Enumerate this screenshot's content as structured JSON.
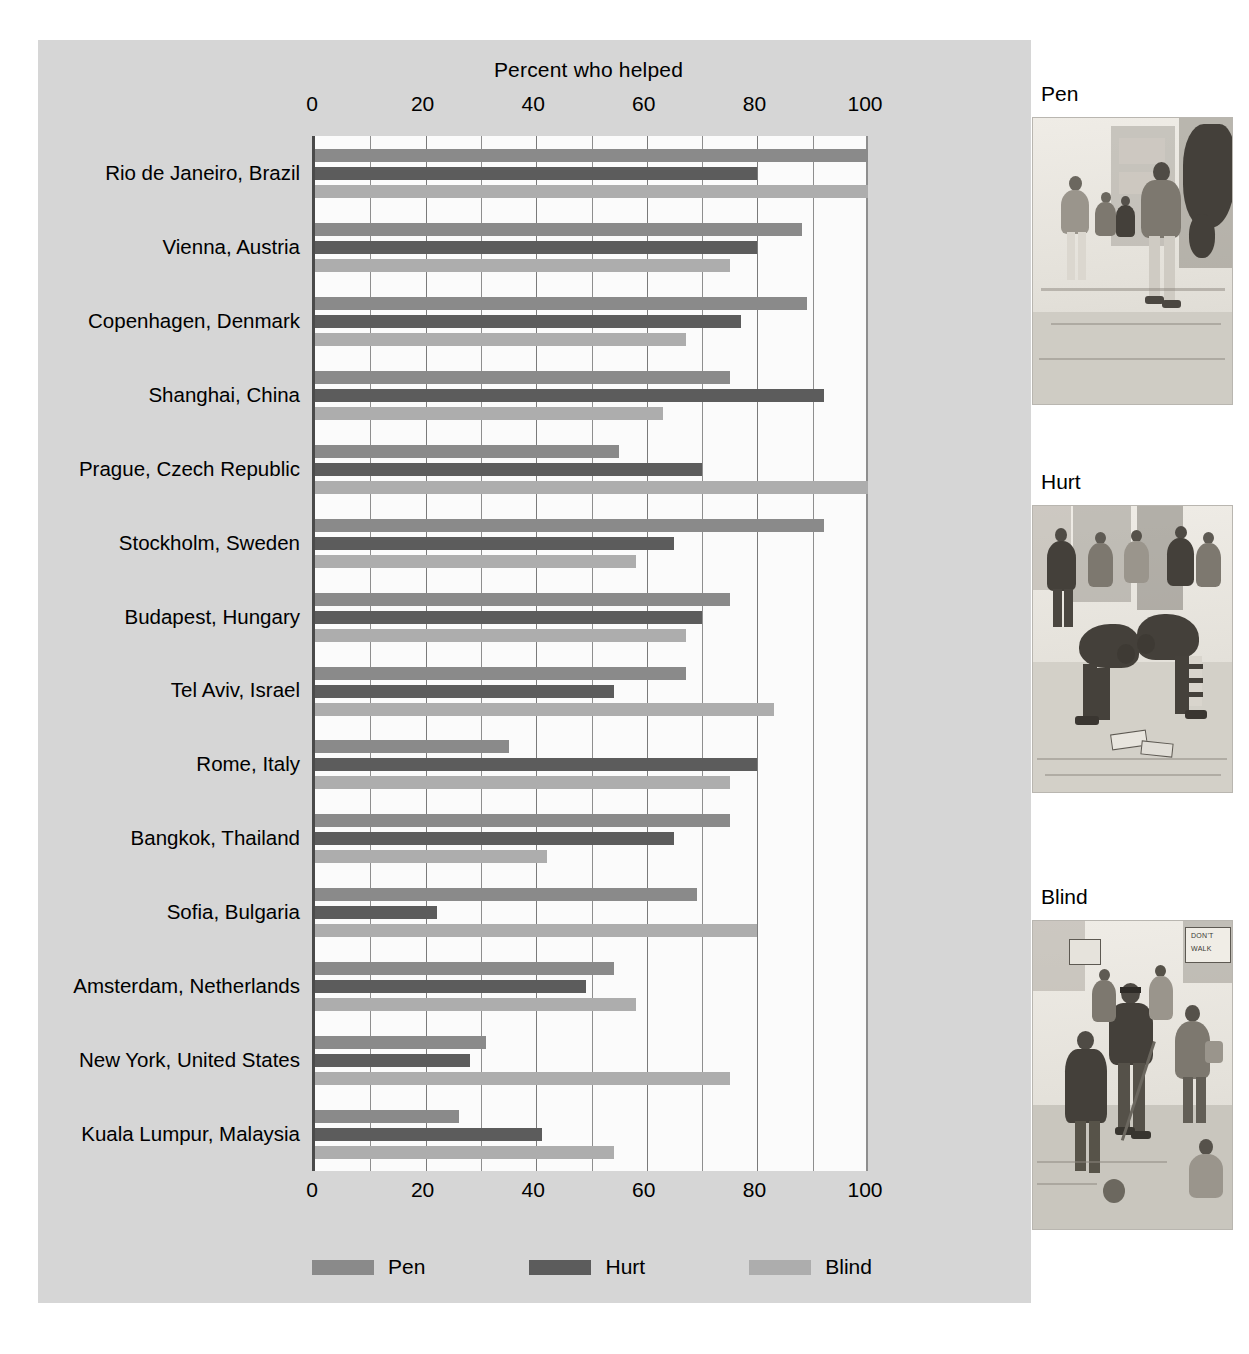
{
  "chart_data": {
    "type": "bar",
    "orientation": "horizontal",
    "grouped": true,
    "title": "Percent who helped",
    "xlabel": "Percent who helped",
    "ylabel": "",
    "xlim": [
      0,
      100
    ],
    "xticks": [
      0,
      20,
      40,
      60,
      80,
      100
    ],
    "grid": true,
    "legend_position": "bottom",
    "categories": [
      "Rio de Janeiro, Brazil",
      "Vienna, Austria",
      "Copenhagen, Denmark",
      "Shanghai, China",
      "Prague, Czech Republic",
      "Stockholm, Sweden",
      "Budapest, Hungary",
      "Tel Aviv, Israel",
      "Rome, Italy",
      "Bangkok, Thailand",
      "Sofia, Bulgaria",
      "Amsterdam, Netherlands",
      "New York, United States",
      "Kuala Lumpur, Malaysia"
    ],
    "series": [
      {
        "name": "Pen",
        "color": "#8a8a8a",
        "values": [
          100,
          88,
          89,
          75,
          55,
          92,
          75,
          67,
          35,
          75,
          69,
          54,
          31,
          26
        ]
      },
      {
        "name": "Hurt",
        "color": "#5c5c5c",
        "values": [
          80,
          80,
          77,
          92,
          70,
          65,
          70,
          54,
          80,
          65,
          22,
          49,
          28,
          41
        ]
      },
      {
        "name": "Blind",
        "color": "#adadad",
        "values": [
          100,
          75,
          67,
          63,
          100,
          58,
          67,
          83,
          75,
          42,
          80,
          58,
          75,
          54
        ]
      }
    ]
  },
  "axis": {
    "tick_labels": [
      "0",
      "20",
      "40",
      "60",
      "80",
      "100"
    ]
  },
  "legend": {
    "items": [
      {
        "label": "Pen"
      },
      {
        "label": "Hurt"
      },
      {
        "label": "Blind"
      }
    ]
  },
  "illustrations": [
    {
      "caption": "Pen",
      "name": "pen-illustration",
      "alt": "Pedestrian dropping a pen on a city street"
    },
    {
      "caption": "Hurt",
      "name": "hurt-illustration",
      "alt": "Person with a leg brace picking up dropped magazines"
    },
    {
      "caption": "Blind",
      "name": "blind-illustration",
      "alt": "Blind man with a white cane at a crosswalk"
    }
  ],
  "illustration_signs": {
    "dont": "DON'T",
    "walk": "WALK"
  },
  "colors": {
    "panel_background": "#d6d6d6",
    "plot_background": "#fbfbfb",
    "axis_line": "#4a4a4a",
    "gridline": "#8e8e8e",
    "pen": "#8a8a8a",
    "hurt": "#5c5c5c",
    "blind": "#adadad"
  }
}
